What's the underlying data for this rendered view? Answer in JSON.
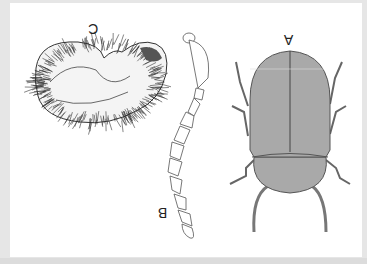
{
  "figure": {
    "orientation": "rotated-180",
    "labels": {
      "a": "A",
      "b": "B",
      "c": "C"
    },
    "panels": [
      {
        "id": "A",
        "subject": "adult beetle, dorsal view"
      },
      {
        "id": "B",
        "subject": "antenna"
      },
      {
        "id": "C",
        "subject": "larva, lateral view"
      }
    ],
    "colors": {
      "body_fill": "#a9a9a9",
      "outline": "#444444",
      "background": "#ffffff",
      "margin": "#e6e6e6"
    }
  }
}
